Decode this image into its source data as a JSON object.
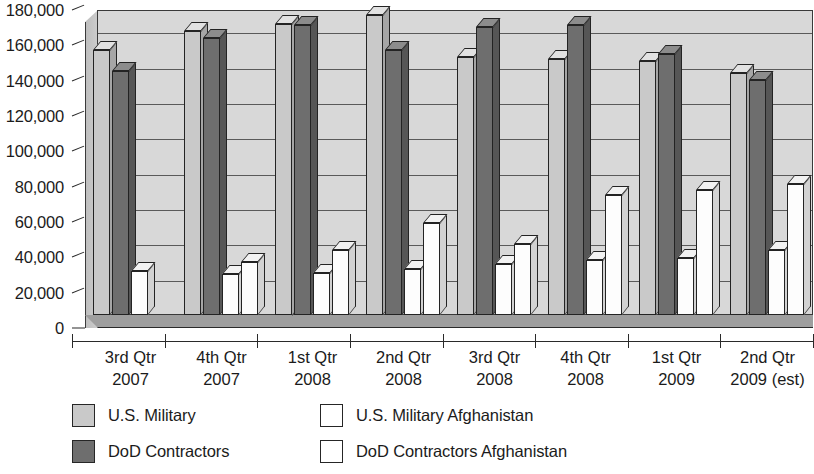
{
  "chart_data": {
    "type": "bar",
    "title": "",
    "subtitle": "",
    "xlabel": "",
    "ylabel": "",
    "ylim": [
      0,
      180000
    ],
    "ytick_labels": [
      "0",
      "20,000",
      "40,000",
      "60,000",
      "80,000",
      "100,000",
      "120,000",
      "140,000",
      "160,000",
      "180,000"
    ],
    "ytick_values": [
      0,
      20000,
      40000,
      60000,
      80000,
      100000,
      120000,
      140000,
      160000,
      180000
    ],
    "grid": true,
    "legend_position": "bottom",
    "categories": [
      {
        "line1": "3rd Qtr",
        "line2": "2007"
      },
      {
        "line1": "4th Qtr",
        "line2": "2007"
      },
      {
        "line1": "1st Qtr",
        "line2": "2008"
      },
      {
        "line1": "2nd Qtr",
        "line2": "2008"
      },
      {
        "line1": "3rd Qtr",
        "line2": "2008"
      },
      {
        "line1": "4th Qtr",
        "line2": "2008"
      },
      {
        "line1": "1st Qtr",
        "line2": "2009"
      },
      {
        "line1": "2nd Qtr",
        "line2": "2009 (est)"
      }
    ],
    "series": [
      {
        "name": "U.S. Military",
        "key": "light",
        "color": "#c9c9c9",
        "values": [
          150000,
          161000,
          165000,
          170000,
          146000,
          145000,
          144000,
          137000
        ]
      },
      {
        "name": "DoD Contractors",
        "key": "dark",
        "color": "#6e6e6e",
        "values": [
          138000,
          157000,
          164000,
          150000,
          163000,
          164000,
          148000,
          133000
        ]
      },
      {
        "name": "U.S. Military Afghanistan",
        "key": "white1",
        "color": "#ffffff",
        "values": [
          25000,
          23000,
          24000,
          26000,
          29000,
          31000,
          32000,
          37000
        ]
      },
      {
        "name": "DoD Contractors Afghanistan",
        "key": "white2",
        "color": "#ffffff",
        "values": [
          null,
          30000,
          37000,
          52000,
          40000,
          68000,
          71000,
          74000
        ]
      }
    ]
  },
  "legend": {
    "items": [
      {
        "label": "U.S. Military",
        "swatch": "sw-light",
        "name": "legend-us-military"
      },
      {
        "label": "DoD Contractors",
        "swatch": "sw-dark",
        "name": "legend-dod-contractors"
      },
      {
        "label": "U.S. Military Afghanistan",
        "swatch": "sw-white",
        "name": "legend-us-military-afghanistan"
      },
      {
        "label": "DoD Contractors Afghanistan",
        "swatch": "sw-white",
        "name": "legend-dod-contractors-afghanistan"
      }
    ]
  }
}
